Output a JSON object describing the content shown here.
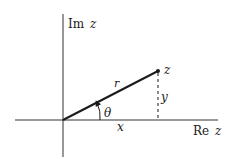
{
  "diagram": {
    "axes": {
      "imaginary_label": "Im",
      "imaginary_var": "z",
      "real_label": "Re",
      "real_var": "z"
    },
    "point_label": "z",
    "radius_label": "r",
    "angle_label": "θ",
    "x_label": "x",
    "y_label": "y",
    "colors": {
      "ink": "#1a1a1a",
      "axis": "#333333",
      "background": "#ffffff"
    }
  }
}
